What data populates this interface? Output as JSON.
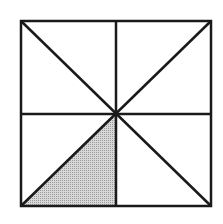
{
  "diagram": {
    "shape": "square",
    "divisions": 8,
    "shaded_count": 1,
    "shaded_region": "lower-left inner triangle (bottom-left corner, bottom-center, center)",
    "colors": {
      "stroke": "#1a1a1a",
      "shade": "#c8c8c8",
      "background": "#ffffff"
    }
  }
}
